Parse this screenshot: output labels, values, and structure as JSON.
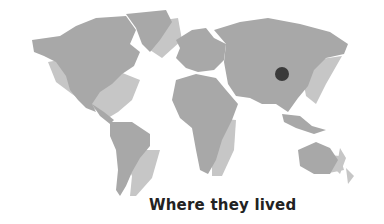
{
  "map": {
    "caption": "Where they lived",
    "marker": {
      "label": "location-marker",
      "x": 282,
      "y": 74,
      "r": 7,
      "color": "#3a3a3a"
    },
    "colors": {
      "land_dark": "#a8a8a8",
      "land_light": "#c6c6c6",
      "background": "#ffffff"
    }
  }
}
